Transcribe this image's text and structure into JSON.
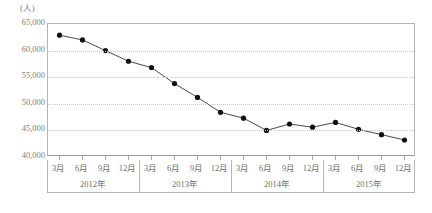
{
  "chart_data": {
    "type": "line",
    "title": "",
    "subtitle": "",
    "unit_label": "(人)",
    "xlabel": "",
    "ylabel": "",
    "ylim": [
      40000,
      65000
    ],
    "ytick_step": 5000,
    "ytick_labels": [
      "65,000",
      "60,000",
      "55,000",
      "50,000",
      "45,000",
      "40,000"
    ],
    "ytick_values": [
      65000,
      60000,
      55000,
      50000,
      45000,
      40000
    ],
    "grid": true,
    "grid_style": "dotted-horizontal",
    "legend": "none",
    "marker": "filled-circle",
    "line_color": "#4a4a4a",
    "marker_color": "#111111",
    "categories": [
      "3月",
      "6月",
      "9月",
      "12月",
      "3月",
      "6月",
      "9月",
      "12月",
      "3月",
      "6月",
      "9月",
      "12月",
      "3月",
      "6月",
      "9月",
      "12月"
    ],
    "values": [
      62900,
      62000,
      60000,
      58000,
      56800,
      53800,
      51200,
      48400,
      47300,
      45000,
      46200,
      45600,
      46500,
      45200,
      44200,
      43200
    ],
    "groups": [
      {
        "label": "2012年",
        "start": 0,
        "count": 4
      },
      {
        "label": "2013年",
        "start": 4,
        "count": 4
      },
      {
        "label": "2014年",
        "start": 8,
        "count": 4
      },
      {
        "label": "2015年",
        "start": 12,
        "count": 4
      }
    ]
  }
}
